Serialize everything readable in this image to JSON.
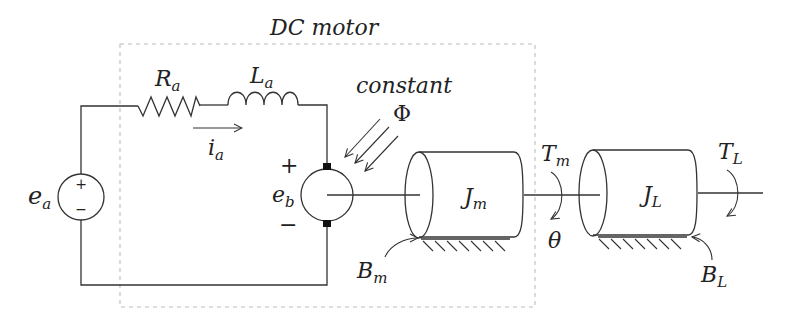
{
  "diagram": {
    "title": "DC motor",
    "boundary_label": "DC motor",
    "circuit": {
      "source": {
        "name": "e",
        "sub": "a",
        "plus": "+",
        "minus": "−"
      },
      "resistor": {
        "name": "R",
        "sub": "a"
      },
      "inductor": {
        "name": "L",
        "sub": "a"
      },
      "current": {
        "name": "i",
        "sub": "a"
      },
      "back_emf": {
        "name": "e",
        "sub": "b",
        "plus": "+",
        "minus": "−"
      }
    },
    "field": {
      "label_top": "constant",
      "label_symbol": "Φ"
    },
    "mechanical": {
      "motor_inertia": {
        "name": "J",
        "sub": "m"
      },
      "motor_damping": {
        "name": "B",
        "sub": "m"
      },
      "motor_torque": {
        "name": "T",
        "sub": "m"
      },
      "angle": {
        "name": "θ"
      },
      "load_inertia": {
        "name": "J",
        "sub": "L"
      },
      "load_damping": {
        "name": "B",
        "sub": "L"
      },
      "load_torque": {
        "name": "T",
        "sub": "L"
      }
    }
  }
}
